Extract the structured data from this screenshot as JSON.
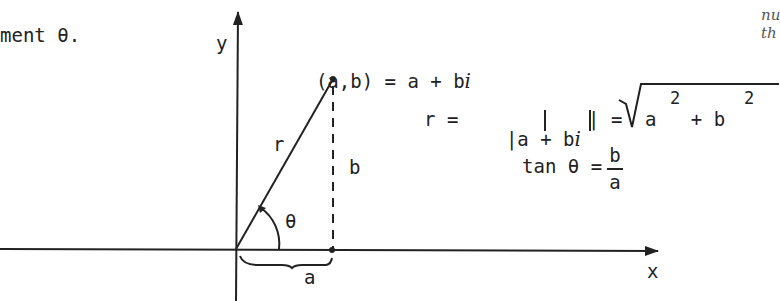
{
  "header_text": "ment θ.",
  "margin_note": [
    "nu",
    "th"
  ],
  "axes": {
    "x_label": "x",
    "y_label": "y"
  },
  "point_label": "(a,b) = a + b",
  "imag_unit": "i",
  "vector_label": "r",
  "vertical_label": "b",
  "horizontal_label": "a",
  "angle_label": "θ",
  "modulus_formula": {
    "lhs": "r =",
    "abs_open": "|a + b",
    "imag_unit": "i",
    "abs_close": "| =",
    "sqrt_body": "a   + b",
    "exp1": "2",
    "exp2": "2"
  },
  "tan_formula": {
    "lhs": "tan θ =",
    "numerator": "b",
    "denominator": "a"
  },
  "colors": {
    "ink": "#222222",
    "background": "#ffffff"
  }
}
